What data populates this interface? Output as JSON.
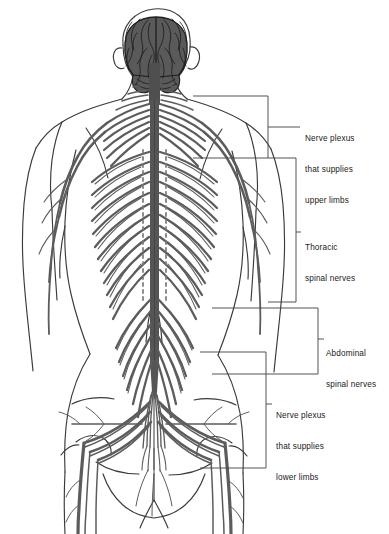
{
  "figure": {
    "view": "posterior (from behind)",
    "background_color": "#ffffff",
    "line_color": "#2b2b2b",
    "nerve_color": "#5c5c5c",
    "brain_fill": "#5a5a5a",
    "brain_outline": "#1e1e1e",
    "body_outline_color": "#3a3a3a",
    "leader_color": "#4a4a4a"
  },
  "labels": {
    "upper_limbs": {
      "line1": "Nerve plexus",
      "line2": "that supplies",
      "line3": "upper limbs",
      "text": "Nerve plexus that supplies upper limbs"
    },
    "thoracic": {
      "line1": "Thoracic",
      "line2": "spinal nerves",
      "text": "Thoracic spinal nerves"
    },
    "abdominal": {
      "line1": "Abdominal",
      "line2": "spinal nerves",
      "text": "Abdominal spinal nerves"
    },
    "lower_limbs": {
      "line1": "Nerve plexus",
      "line2": "that supplies",
      "line3": "lower limbs",
      "text": "Nerve plexus that supplies lower limbs"
    }
  },
  "structures": {
    "brain": "brain",
    "spinal_cord": "spinal cord",
    "cervical_plexus": "cervical and brachial plexus",
    "intercostal_nerves": "thoracic intercostal nerves",
    "lumbar_nerves": "lumbar spinal nerves",
    "cauda_equina": "cauda equina",
    "lumbosacral_plexus": "lumbosacral plexus",
    "sciatic_nerve": "sciatic nerve",
    "head": "head",
    "torso": "torso",
    "pelvis": "pelvis",
    "arms": "arms",
    "legs": "legs"
  }
}
